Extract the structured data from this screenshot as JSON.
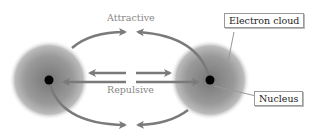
{
  "diagram": {
    "labels": {
      "attractive": "Attractive",
      "repulsive": "Repulsive",
      "electron_cloud": "Electron cloud",
      "nucleus": "Nucleus"
    },
    "colors": {
      "arrow": "#7a7a7a",
      "nucleus": "#000000",
      "cloud": "#8a8a8a",
      "label": "#888888"
    },
    "atoms": [
      {
        "name": "left-atom",
        "nucleus_x": 49,
        "nucleus_y": 80
      },
      {
        "name": "right-atom",
        "nucleus_x": 210,
        "nucleus_y": 80
      }
    ]
  }
}
